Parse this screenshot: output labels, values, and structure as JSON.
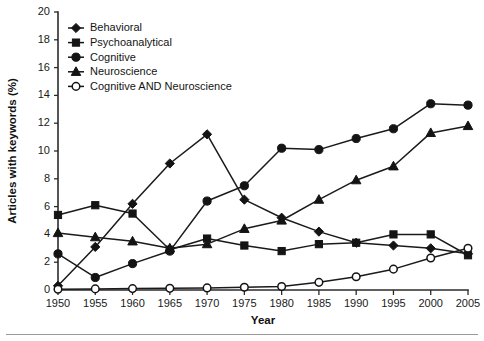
{
  "chart_data": {
    "type": "line",
    "title": "",
    "xlabel": "Year",
    "ylabel": "Articles with keywords (%)",
    "x": [
      1950,
      1955,
      1960,
      1965,
      1970,
      1975,
      1980,
      1985,
      1990,
      1995,
      2000,
      2005
    ],
    "xlim": [
      1950,
      2005
    ],
    "ylim": [
      0,
      20
    ],
    "ytick_step": 2,
    "xtick_labels": [
      "1950",
      "1955",
      "1960",
      "1965",
      "1970",
      "1975",
      "1980",
      "1985",
      "1990",
      "1995",
      "2000",
      "2005"
    ],
    "ytick_labels": [
      "0",
      "2",
      "4",
      "6",
      "8",
      "10",
      "12",
      "14",
      "16",
      "18",
      "20"
    ],
    "grid": false,
    "legend_position": "top-left-inside",
    "series": [
      {
        "name": "Behavioral",
        "marker": "diamond",
        "values": [
          0.3,
          3.1,
          6.2,
          9.1,
          11.2,
          6.5,
          5.2,
          4.2,
          3.4,
          3.2,
          3.0,
          2.6
        ]
      },
      {
        "name": "Psychoanalytical",
        "marker": "square",
        "values": [
          5.4,
          6.1,
          5.5,
          2.9,
          3.7,
          3.2,
          2.8,
          3.3,
          3.4,
          4.0,
          4.0,
          2.5
        ]
      },
      {
        "name": "Cognitive",
        "marker": "circle",
        "values": [
          2.6,
          0.9,
          1.9,
          2.8,
          6.4,
          7.5,
          10.2,
          10.1,
          10.9,
          11.6,
          13.4,
          13.3
        ]
      },
      {
        "name": "Neuroscience",
        "marker": "triangle",
        "values": [
          4.1,
          3.8,
          3.5,
          3.0,
          3.3,
          4.4,
          5.0,
          6.5,
          7.9,
          8.9,
          11.3,
          11.8
        ]
      },
      {
        "name": "Cognitive AND Neuroscience",
        "marker": "open-circle",
        "values": [
          0.05,
          0.08,
          0.1,
          0.12,
          0.15,
          0.2,
          0.25,
          0.55,
          0.95,
          1.5,
          2.3,
          3.0
        ]
      }
    ]
  }
}
